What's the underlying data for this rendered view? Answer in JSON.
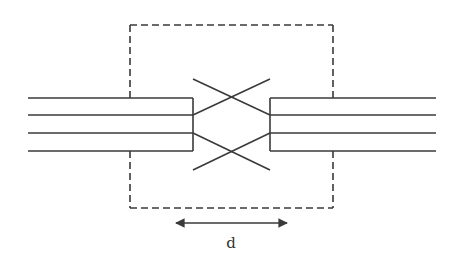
{
  "diagram": {
    "type": "waveguide-crossing-schematic",
    "labels": {
      "distance": "d"
    },
    "colors": {
      "line": "#3a3a3a",
      "dashed_box": "#3a3a3a",
      "background": "#ffffff"
    },
    "elements": {
      "left_waveguide_bundle": {
        "line_count": 4
      },
      "right_waveguide_bundle": {
        "line_count": 4
      },
      "crossing_region": {
        "crossings": 2
      },
      "dashed_boundary": {
        "style": "dashed"
      },
      "dimension_arrow": {
        "style": "double-headed",
        "label": "d"
      }
    }
  }
}
